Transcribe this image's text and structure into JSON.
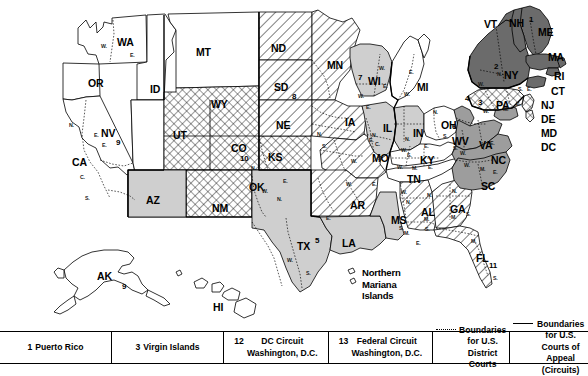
{
  "map": {
    "title": "Geographic Boundaries of United States Courts of Appeals and United States District Courts",
    "states": [
      {
        "abbr": "WA",
        "x": 117,
        "y": 37
      },
      {
        "abbr": "OR",
        "x": 88,
        "y": 78
      },
      {
        "abbr": "ID",
        "x": 150,
        "y": 84
      },
      {
        "abbr": "MT",
        "x": 196,
        "y": 47
      },
      {
        "abbr": "ND",
        "x": 271,
        "y": 43
      },
      {
        "abbr": "SD",
        "x": 274,
        "y": 82
      },
      {
        "abbr": "NE",
        "x": 276,
        "y": 120
      },
      {
        "abbr": "MN",
        "x": 327,
        "y": 60
      },
      {
        "abbr": "WI",
        "x": 368,
        "y": 76
      },
      {
        "abbr": "IA",
        "x": 345,
        "y": 117
      },
      {
        "abbr": "MI",
        "x": 417,
        "y": 82
      },
      {
        "abbr": "WY",
        "x": 211,
        "y": 99
      },
      {
        "abbr": "NV",
        "x": 101,
        "y": 128
      },
      {
        "abbr": "UT",
        "x": 173,
        "y": 130
      },
      {
        "abbr": "CO",
        "x": 231,
        "y": 143
      },
      {
        "abbr": "KS",
        "x": 268,
        "y": 152
      },
      {
        "abbr": "CA",
        "x": 72,
        "y": 157
      },
      {
        "abbr": "AZ",
        "x": 146,
        "y": 195
      },
      {
        "abbr": "NM",
        "x": 212,
        "y": 203
      },
      {
        "abbr": "OK",
        "x": 249,
        "y": 182
      },
      {
        "abbr": "TX",
        "x": 297,
        "y": 241
      },
      {
        "abbr": "MO",
        "x": 372,
        "y": 153
      },
      {
        "abbr": "AR",
        "x": 350,
        "y": 200
      },
      {
        "abbr": "LA",
        "x": 342,
        "y": 238
      },
      {
        "abbr": "MS",
        "x": 391,
        "y": 215
      },
      {
        "abbr": "AL",
        "x": 421,
        "y": 207
      },
      {
        "abbr": "GA",
        "x": 450,
        "y": 204
      },
      {
        "abbr": "FL",
        "x": 476,
        "y": 253
      },
      {
        "abbr": "TN",
        "x": 407,
        "y": 174
      },
      {
        "abbr": "KY",
        "x": 420,
        "y": 155
      },
      {
        "abbr": "IL",
        "x": 383,
        "y": 123
      },
      {
        "abbr": "IN",
        "x": 413,
        "y": 128
      },
      {
        "abbr": "OH",
        "x": 441,
        "y": 120
      },
      {
        "abbr": "WV",
        "x": 452,
        "y": 136
      },
      {
        "abbr": "VA",
        "x": 479,
        "y": 140
      },
      {
        "abbr": "NC",
        "x": 491,
        "y": 155
      },
      {
        "abbr": "SC",
        "x": 481,
        "y": 181
      },
      {
        "abbr": "PA",
        "x": 496,
        "y": 100
      },
      {
        "abbr": "NY",
        "x": 504,
        "y": 70
      },
      {
        "abbr": "VT",
        "x": 484,
        "y": 19
      },
      {
        "abbr": "NH",
        "x": 509,
        "y": 18
      },
      {
        "abbr": "ME",
        "x": 538,
        "y": 27
      },
      {
        "abbr": "MA",
        "x": 548,
        "y": 52
      },
      {
        "abbr": "RI",
        "x": 554,
        "y": 71
      },
      {
        "abbr": "CT",
        "x": 551,
        "y": 86
      },
      {
        "abbr": "NJ",
        "x": 541,
        "y": 100
      },
      {
        "abbr": "DE",
        "x": 541,
        "y": 114
      },
      {
        "abbr": "MD",
        "x": 541,
        "y": 128
      },
      {
        "abbr": "DC",
        "x": 541,
        "y": 142
      },
      {
        "abbr": "AK",
        "x": 97,
        "y": 271
      },
      {
        "abbr": "HI",
        "x": 213,
        "y": 302
      }
    ],
    "circuit_numbers": [
      {
        "n": "9",
        "x": 116,
        "y": 139
      },
      {
        "n": "9",
        "x": 122,
        "y": 283
      },
      {
        "n": "10",
        "x": 240,
        "y": 155
      },
      {
        "n": "8",
        "x": 292,
        "y": 93
      },
      {
        "n": "7",
        "x": 358,
        "y": 74
      },
      {
        "n": "5",
        "x": 315,
        "y": 237
      },
      {
        "n": "6",
        "x": 452,
        "y": 123
      },
      {
        "n": "1",
        "x": 529,
        "y": 16
      },
      {
        "n": "2",
        "x": 494,
        "y": 63
      },
      {
        "n": "3",
        "x": 478,
        "y": 99
      },
      {
        "n": "4",
        "x": 465,
        "y": 95
      },
      {
        "n": "11",
        "x": 489,
        "y": 262
      }
    ],
    "division_marks": [
      {
        "t": "W.",
        "x": 101,
        "y": 44
      },
      {
        "t": "E.",
        "x": 130,
        "y": 53
      },
      {
        "t": "N.",
        "x": 69,
        "y": 123
      },
      {
        "t": "E.",
        "x": 94,
        "y": 133
      },
      {
        "t": "C.",
        "x": 80,
        "y": 175
      },
      {
        "t": "S.",
        "x": 85,
        "y": 196
      },
      {
        "t": "E.",
        "x": 102,
        "y": 143
      },
      {
        "t": "N.",
        "x": 317,
        "y": 132
      },
      {
        "t": "S.",
        "x": 322,
        "y": 144
      },
      {
        "t": "W.",
        "x": 358,
        "y": 94
      },
      {
        "t": "E.",
        "x": 366,
        "y": 105
      },
      {
        "t": "W.",
        "x": 379,
        "y": 66
      },
      {
        "t": "E.",
        "x": 383,
        "y": 84
      },
      {
        "t": "N.",
        "x": 372,
        "y": 133
      },
      {
        "t": "C.",
        "x": 375,
        "y": 142
      },
      {
        "t": "S.",
        "x": 378,
        "y": 156
      },
      {
        "t": "N.",
        "x": 405,
        "y": 137
      },
      {
        "t": "S.",
        "x": 407,
        "y": 153
      },
      {
        "t": "E.",
        "x": 409,
        "y": 70
      },
      {
        "t": "W.",
        "x": 404,
        "y": 92
      },
      {
        "t": "N.",
        "x": 433,
        "y": 110
      },
      {
        "t": "S.",
        "x": 443,
        "y": 134
      },
      {
        "t": "W.",
        "x": 351,
        "y": 159
      },
      {
        "t": "E.",
        "x": 369,
        "y": 138
      },
      {
        "t": "E.",
        "x": 372,
        "y": 182
      },
      {
        "t": "W.",
        "x": 346,
        "y": 182
      },
      {
        "t": "N.",
        "x": 277,
        "y": 197
      },
      {
        "t": "E.",
        "x": 326,
        "y": 216
      },
      {
        "t": "W.",
        "x": 287,
        "y": 258
      },
      {
        "t": "S.",
        "x": 306,
        "y": 271
      },
      {
        "t": "N.",
        "x": 251,
        "y": 166
      },
      {
        "t": "E.",
        "x": 283,
        "y": 179
      },
      {
        "t": "W.",
        "x": 262,
        "y": 189
      },
      {
        "t": "W.",
        "x": 401,
        "y": 190
      },
      {
        "t": "N.",
        "x": 406,
        "y": 200
      },
      {
        "t": "S.",
        "x": 399,
        "y": 226
      },
      {
        "t": "M.",
        "x": 404,
        "y": 231
      },
      {
        "t": "E.",
        "x": 416,
        "y": 241
      },
      {
        "t": "N.",
        "x": 427,
        "y": 193
      },
      {
        "t": "M.",
        "x": 424,
        "y": 217
      },
      {
        "t": "S.",
        "x": 425,
        "y": 227
      },
      {
        "t": "N.",
        "x": 452,
        "y": 189
      },
      {
        "t": "M.",
        "x": 451,
        "y": 215
      },
      {
        "t": "S.",
        "x": 466,
        "y": 212
      },
      {
        "t": "M.",
        "x": 471,
        "y": 239
      },
      {
        "t": "S.",
        "x": 493,
        "y": 276
      },
      {
        "t": "W.",
        "x": 397,
        "y": 165
      },
      {
        "t": "M.",
        "x": 412,
        "y": 166
      },
      {
        "t": "E.",
        "x": 428,
        "y": 165
      },
      {
        "t": "E.",
        "x": 424,
        "y": 144
      },
      {
        "t": "W.",
        "x": 401,
        "y": 148
      },
      {
        "t": "S.",
        "x": 453,
        "y": 146
      },
      {
        "t": "W.",
        "x": 460,
        "y": 151
      },
      {
        "t": "E.",
        "x": 490,
        "y": 141
      },
      {
        "t": "M.",
        "x": 480,
        "y": 167
      },
      {
        "t": "W.",
        "x": 464,
        "y": 163
      },
      {
        "t": "E.",
        "x": 493,
        "y": 170
      },
      {
        "t": "W.",
        "x": 483,
        "y": 109
      },
      {
        "t": "E.",
        "x": 516,
        "y": 102
      },
      {
        "t": "M.",
        "x": 503,
        "y": 107
      },
      {
        "t": "W.",
        "x": 478,
        "y": 82
      },
      {
        "t": "N.",
        "x": 497,
        "y": 72
      },
      {
        "t": "S.",
        "x": 518,
        "y": 87
      },
      {
        "t": "E.",
        "x": 527,
        "y": 87
      }
    ],
    "island_labels": [
      {
        "text": "Northern\nMariana\nIslands",
        "x": 362,
        "y": 267
      }
    ],
    "colors": {
      "circuit1_2_fill": "#6b6b6b",
      "circuit4_fill": "#9d9d9d",
      "circuit5_7_fill": "#cfcfcf",
      "white_fill": "#ffffff",
      "stroke": "#000000",
      "hatch": "#000000"
    }
  },
  "legend": {
    "items": [
      {
        "num": "1",
        "lines": [
          "Puerto Rico"
        ],
        "kind": "num"
      },
      {
        "num": "3",
        "lines": [
          "Virgin Islands"
        ],
        "kind": "num"
      },
      {
        "num": "12",
        "lines": [
          "DC Circuit",
          "Washington, D.C."
        ],
        "kind": "num"
      },
      {
        "num": "13",
        "lines": [
          "Federal Circuit",
          "Washington, D.C."
        ],
        "kind": "num"
      },
      {
        "num": "",
        "lines": [
          "Boundaries for U.S.",
          "District Courts"
        ],
        "kind": "dotted"
      },
      {
        "num": "",
        "lines": [
          "Boundaries for U.S.",
          "Courts of Appeal (Circuits)"
        ],
        "kind": "solid"
      }
    ]
  }
}
